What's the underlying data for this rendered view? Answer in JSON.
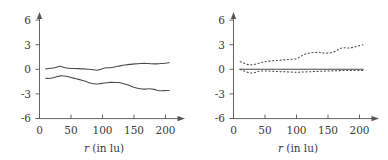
{
  "figure": {
    "background_color": "#ffffff",
    "line_color": "#4a4a4a",
    "axis_color": "#555555",
    "text_color": "#3b3b3b",
    "panel_count": 2
  },
  "chart_data": [
    {
      "type": "line",
      "panel": "left",
      "title": "",
      "xlabel": "r (in lu)",
      "xlabel_italic_part": "r",
      "xlabel_rest": " (in lu)",
      "ylabel": "",
      "xlim": [
        0,
        210
      ],
      "ylim": [
        -6,
        6
      ],
      "xticks": [
        0,
        50,
        100,
        150,
        200
      ],
      "xtick_labels": [
        "0",
        "50",
        "100",
        "150",
        "200"
      ],
      "yticks": [
        -6,
        -3,
        0,
        3,
        6
      ],
      "ytick_labels": [
        "-6",
        "-3",
        "0",
        "3",
        "6"
      ],
      "grid": false,
      "legend": "none",
      "series": [
        {
          "name": "upper-solid",
          "style": "solid",
          "x": [
            10,
            18,
            26,
            32,
            38,
            46,
            54,
            62,
            70,
            78,
            86,
            92,
            98,
            104,
            112,
            120,
            128,
            136,
            144,
            152,
            160,
            168,
            176,
            184,
            192,
            200,
            206
          ],
          "y": [
            0.05,
            0.12,
            0.22,
            0.38,
            0.25,
            0.12,
            0.1,
            0.08,
            0.05,
            0.0,
            -0.05,
            -0.12,
            0.02,
            0.15,
            0.2,
            0.3,
            0.42,
            0.52,
            0.6,
            0.66,
            0.7,
            0.72,
            0.68,
            0.66,
            0.7,
            0.74,
            0.8
          ]
        },
        {
          "name": "lower-solid",
          "style": "solid",
          "x": [
            10,
            18,
            26,
            34,
            42,
            50,
            58,
            66,
            74,
            82,
            90,
            96,
            102,
            110,
            118,
            126,
            134,
            142,
            150,
            158,
            166,
            174,
            182,
            190,
            198,
            206
          ],
          "y": [
            -1.1,
            -1.1,
            -0.95,
            -0.8,
            -0.85,
            -1.0,
            -1.15,
            -1.3,
            -1.5,
            -1.7,
            -1.8,
            -1.75,
            -1.68,
            -1.6,
            -1.6,
            -1.62,
            -1.75,
            -1.95,
            -2.2,
            -2.35,
            -2.42,
            -2.38,
            -2.45,
            -2.62,
            -2.6,
            -2.58
          ]
        }
      ]
    },
    {
      "type": "line",
      "panel": "right",
      "title": "",
      "xlabel": "r (in lu)",
      "xlabel_italic_part": "r",
      "xlabel_rest": " (in lu)",
      "ylabel": "",
      "xlim": [
        0,
        210
      ],
      "ylim": [
        -6,
        6
      ],
      "xticks": [
        0,
        50,
        100,
        150,
        200
      ],
      "xtick_labels": [
        "0",
        "50",
        "100",
        "150",
        "200"
      ],
      "yticks": [
        -6,
        -3,
        0,
        3,
        6
      ],
      "ytick_labels": [
        "-6",
        "-3",
        "0",
        "3",
        "6"
      ],
      "grid": false,
      "legend": "none",
      "series": [
        {
          "name": "upper-dashed",
          "style": "dashed",
          "x": [
            10,
            16,
            22,
            28,
            34,
            40,
            46,
            52,
            60,
            68,
            76,
            84,
            92,
            100,
            106,
            112,
            118,
            124,
            130,
            136,
            142,
            150,
            158,
            166,
            172,
            178,
            184,
            190,
            198,
            206
          ],
          "y": [
            0.95,
            0.78,
            0.6,
            0.55,
            0.62,
            0.75,
            0.86,
            0.95,
            1.02,
            1.08,
            1.12,
            1.18,
            1.22,
            1.3,
            1.55,
            1.8,
            1.95,
            2.02,
            2.05,
            2.08,
            2.0,
            1.98,
            2.08,
            2.38,
            2.6,
            2.62,
            2.6,
            2.68,
            2.85,
            3.0
          ]
        },
        {
          "name": "lower-dashed",
          "style": "dashed",
          "x": [
            10,
            16,
            22,
            28,
            34,
            40,
            48,
            56,
            64,
            72,
            80,
            88,
            96,
            104,
            112,
            120,
            128,
            136,
            144,
            152,
            160,
            168,
            176,
            184,
            192,
            200,
            206
          ],
          "y": [
            0.0,
            -0.18,
            -0.35,
            -0.45,
            -0.4,
            -0.25,
            -0.2,
            -0.22,
            -0.25,
            -0.28,
            -0.3,
            -0.32,
            -0.35,
            -0.35,
            -0.32,
            -0.3,
            -0.28,
            -0.25,
            -0.22,
            -0.2,
            -0.18,
            -0.16,
            -0.15,
            -0.14,
            -0.14,
            -0.14,
            -0.15
          ]
        },
        {
          "name": "zero-baseline",
          "style": "solid",
          "x": [
            10,
            206
          ],
          "y": [
            0.0,
            0.0
          ]
        }
      ]
    }
  ]
}
